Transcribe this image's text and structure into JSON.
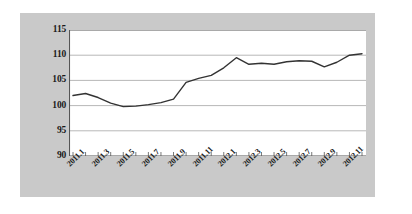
{
  "chart_data": {
    "type": "line",
    "title": "",
    "subtitle": "",
    "xlabel": "",
    "ylabel": "",
    "ylim": [
      90,
      115
    ],
    "yticks": [
      90,
      95,
      100,
      105,
      110,
      115
    ],
    "ytick_labels": [
      "90",
      "95",
      "100",
      "105",
      "110",
      "115"
    ],
    "grid": "horizontal",
    "legend": "none",
    "line_color": "#333333",
    "plot_background": "#ffffff",
    "panel_background": "#c9c9c9",
    "x": [
      "2011.1",
      "2011.2",
      "2011.3",
      "2011.4",
      "2011.5",
      "2011.6",
      "2011.7",
      "2011.8",
      "2011.9",
      "2011.10",
      "2011.11",
      "2011.12",
      "2012.1",
      "2012.2",
      "2012.3",
      "2012.4",
      "2012.5",
      "2012.6",
      "2012.7",
      "2012.8",
      "2012.9",
      "2012.10",
      "2012.11",
      "2012.12"
    ],
    "xtick_labels": [
      "2011.1",
      "2011.3",
      "2011.5",
      "2011.7",
      "2011.9",
      "2011.11",
      "2012.1",
      "2012.3",
      "2012.5",
      "2012.7",
      "2012.9",
      "2012.11"
    ],
    "values": [
      102.0,
      102.4,
      101.6,
      100.5,
      99.8,
      99.9,
      100.2,
      100.6,
      101.3,
      104.6,
      105.4,
      106.0,
      107.5,
      109.5,
      108.2,
      108.4,
      108.2,
      108.7,
      108.9,
      108.8,
      107.7,
      108.6,
      110.0,
      110.3
    ],
    "series": [
      {
        "name": "index",
        "values": [
          102.0,
          102.4,
          101.6,
          100.5,
          99.8,
          99.9,
          100.2,
          100.6,
          101.3,
          104.6,
          105.4,
          106.0,
          107.5,
          109.5,
          108.2,
          108.4,
          108.2,
          108.7,
          108.9,
          108.8,
          107.7,
          108.6,
          110.0,
          110.3
        ]
      }
    ]
  }
}
